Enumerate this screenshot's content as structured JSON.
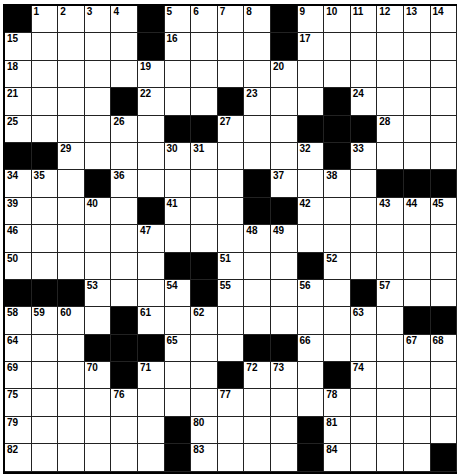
{
  "puzzle": {
    "cols": 17,
    "rows": 17,
    "colors": {
      "block": "#000000",
      "cell": "#ffffff",
      "line": "#222222"
    },
    "grid": [
      [
        "#",
        "1",
        "2",
        "3",
        "4",
        "#",
        "5",
        "6",
        "7",
        "8",
        "#",
        "9",
        "10",
        "11",
        "12",
        "13",
        "14"
      ],
      [
        "15",
        ".",
        ".",
        ".",
        ".",
        "#",
        "16",
        ".",
        ".",
        ".",
        "#",
        "17",
        ".",
        ".",
        ".",
        ".",
        "."
      ],
      [
        "18",
        ".",
        ".",
        ".",
        ".",
        "19",
        ".",
        ".",
        ".",
        ".",
        "20",
        ".",
        ".",
        ".",
        ".",
        ".",
        "."
      ],
      [
        "21",
        ".",
        ".",
        ".",
        "#",
        "22",
        ".",
        ".",
        "#",
        "23",
        ".",
        ".",
        "#",
        "24",
        ".",
        ".",
        "."
      ],
      [
        "25",
        ".",
        ".",
        ".",
        "26",
        ".",
        "#",
        "#",
        "27",
        ".",
        ".",
        "#",
        "#",
        "#",
        "28",
        ".",
        "."
      ],
      [
        "#",
        "#",
        "29",
        ".",
        ".",
        ".",
        "30",
        "31",
        ".",
        ".",
        ".",
        "32",
        "#",
        "33",
        ".",
        ".",
        "."
      ],
      [
        "34",
        "35",
        ".",
        "#",
        "36",
        ".",
        ".",
        ".",
        ".",
        "#",
        "37",
        ".",
        "38",
        ".",
        "#",
        "#",
        "#"
      ],
      [
        "39",
        ".",
        ".",
        "40",
        ".",
        "#",
        "41",
        ".",
        ".",
        "#",
        "#",
        "42",
        ".",
        ".",
        "43",
        "44",
        "45"
      ],
      [
        "46",
        ".",
        ".",
        ".",
        ".",
        "47",
        ".",
        ".",
        ".",
        "48",
        "49",
        ".",
        ".",
        ".",
        ".",
        ".",
        "."
      ],
      [
        "50",
        ".",
        ".",
        ".",
        ".",
        ".",
        "#",
        "#",
        "51",
        ".",
        ".",
        "#",
        "52",
        ".",
        ".",
        ".",
        "."
      ],
      [
        "#",
        "#",
        "#",
        "53",
        ".",
        ".",
        "54",
        "#",
        "55",
        ".",
        ".",
        "56",
        ".",
        "#",
        "57",
        ".",
        "."
      ],
      [
        "58",
        "59",
        "60",
        ".",
        "#",
        "61",
        ".",
        "62",
        ".",
        ".",
        ".",
        ".",
        ".",
        "63",
        ".",
        "#",
        "#"
      ],
      [
        "64",
        ".",
        ".",
        "#",
        "#",
        "#",
        "65",
        ".",
        ".",
        "#",
        "#",
        "66",
        ".",
        ".",
        ".",
        "67",
        "68"
      ],
      [
        "69",
        ".",
        ".",
        "70",
        "#",
        "71",
        ".",
        ".",
        "#",
        "72",
        "73",
        ".",
        "#",
        "74",
        ".",
        ".",
        "."
      ],
      [
        "75",
        ".",
        ".",
        ".",
        "76",
        ".",
        ".",
        ".",
        "77",
        ".",
        ".",
        ".",
        "78",
        ".",
        ".",
        ".",
        "."
      ],
      [
        "79",
        ".",
        ".",
        ".",
        ".",
        ".",
        "#",
        "80",
        ".",
        ".",
        ".",
        "#",
        "81",
        ".",
        ".",
        ".",
        "."
      ],
      [
        "82",
        ".",
        ".",
        ".",
        ".",
        ".",
        "#",
        "83",
        ".",
        ".",
        ".",
        "#",
        "84",
        ".",
        ".",
        ".",
        "#"
      ]
    ]
  }
}
